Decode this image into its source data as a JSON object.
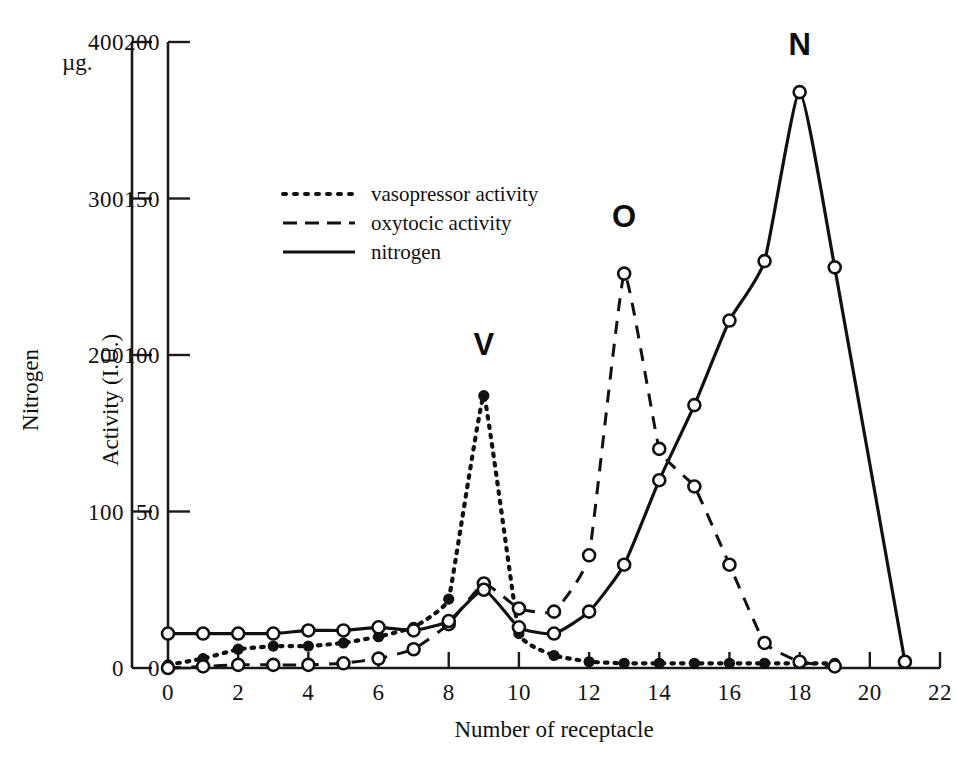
{
  "figure": {
    "background": "#ffffff",
    "ink_color": "#111111"
  },
  "axes": {
    "left_nitrogen": {
      "title": "Nitrogen",
      "unit_label": "µg.",
      "ticks": [
        {
          "value": 0,
          "label": "0"
        },
        {
          "value": 100,
          "label": "100"
        },
        {
          "value": 200,
          "label": "200"
        },
        {
          "value": 300,
          "label": "300"
        },
        {
          "value": 400,
          "label": "400"
        }
      ],
      "min": 0,
      "max": 400
    },
    "right_activity": {
      "title": "Activity (I.U.)",
      "ticks": [
        {
          "value": 0,
          "label": "0"
        },
        {
          "value": 50,
          "label": "50"
        },
        {
          "value": 100,
          "label": "100"
        },
        {
          "value": 150,
          "label": "150"
        },
        {
          "value": 200,
          "label": "200"
        }
      ],
      "min": 0,
      "max": 200
    },
    "x": {
      "title": "Number of receptacle",
      "ticks": [
        {
          "value": 0,
          "label": "0"
        },
        {
          "value": 2,
          "label": "2"
        },
        {
          "value": 4,
          "label": "4"
        },
        {
          "value": 6,
          "label": "6"
        },
        {
          "value": 8,
          "label": "8"
        },
        {
          "value": 10,
          "label": "10"
        },
        {
          "value": 12,
          "label": "12"
        },
        {
          "value": 14,
          "label": "14"
        },
        {
          "value": 16,
          "label": "16"
        },
        {
          "value": 18,
          "label": "18"
        },
        {
          "value": 20,
          "label": "20"
        },
        {
          "value": 22,
          "label": "22"
        }
      ],
      "min": 0,
      "max": 22
    }
  },
  "legend": {
    "entries": [
      {
        "label": "vasopressor activity",
        "style": "dotted"
      },
      {
        "label": "oxytocic activity",
        "style": "dashed"
      },
      {
        "label": "nitrogen",
        "style": "solid"
      }
    ]
  },
  "peak_labels": [
    {
      "text": "V",
      "x": 9,
      "y": 100
    },
    {
      "text": "O",
      "x": 13,
      "y": 141
    },
    {
      "text": "N",
      "x": 18,
      "y": 196
    }
  ],
  "chart_data": {
    "type": "line",
    "title": "",
    "xlabel": "Number of receptacle",
    "ylabel": "Activity (I.U.)",
    "ylabel_secondary": "Nitrogen (µg.)",
    "xlim": [
      0,
      22
    ],
    "ylim": [
      0,
      200
    ],
    "ylim_secondary": [
      0,
      400
    ],
    "grid": false,
    "legend_position": "upper-left-inside",
    "note": "Nitrogen series is plotted against the left (µg.) axis, which is exactly 2× the right Activity (I.U.) axis; values below are given in Activity-axis units with nitrogen_ug giving the left-axis reading.",
    "series": [
      {
        "name": "vasopressor activity",
        "style": "dotted",
        "marker": "filled-circle",
        "x": [
          0,
          1,
          2,
          3,
          4,
          5,
          6,
          7,
          8,
          9,
          10,
          11,
          12,
          13,
          14,
          15,
          16,
          17,
          18,
          19
        ],
        "values": [
          1,
          3,
          6,
          7,
          7,
          8,
          10,
          13,
          22,
          87,
          11,
          4,
          2,
          1.5,
          1.5,
          1.5,
          1.5,
          1.5,
          1.5,
          1.5
        ]
      },
      {
        "name": "oxytocic activity",
        "style": "dashed",
        "marker": "open-circle",
        "x": [
          0,
          1,
          2,
          3,
          4,
          5,
          6,
          7,
          8,
          9,
          10,
          11,
          12,
          13,
          14,
          15,
          16,
          17,
          18,
          19
        ],
        "values": [
          0,
          0.5,
          1,
          1,
          1,
          1.5,
          3,
          6,
          14,
          27,
          19,
          18,
          36,
          126,
          70,
          58,
          33,
          8,
          2,
          0.5
        ]
      },
      {
        "name": "nitrogen",
        "style": "solid",
        "marker": "open-circle",
        "x": [
          0,
          1,
          2,
          3,
          4,
          5,
          6,
          7,
          8,
          9,
          10,
          11,
          12,
          13,
          14,
          15,
          16,
          17,
          18,
          19,
          21
        ],
        "values": [
          11,
          11,
          11,
          11,
          12,
          12,
          13,
          12,
          15,
          25,
          13,
          11,
          18,
          33,
          60,
          84,
          111,
          130,
          184,
          128,
          2
        ],
        "nitrogen_ug": [
          22,
          22,
          22,
          22,
          24,
          24,
          26,
          24,
          30,
          50,
          26,
          22,
          36,
          66,
          120,
          168,
          222,
          260,
          368,
          256,
          4
        ]
      }
    ]
  }
}
